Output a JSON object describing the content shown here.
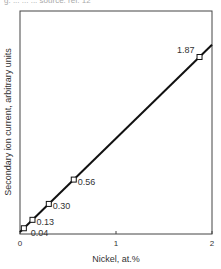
{
  "figure": {
    "caption_fragment": "g. ... ... ... source: ref. 12"
  },
  "chart_data": {
    "type": "line",
    "title": "",
    "xlabel": "Nickel, at.%",
    "ylabel": "Secondary ion current, arbitrary units",
    "xlim": [
      0,
      2
    ],
    "x_ticks": [
      "0",
      "1",
      "2"
    ],
    "grid": false,
    "legend": null,
    "series": [
      {
        "name": "Ni calibration",
        "marker": "open-square",
        "line": "linear fit",
        "points": [
          {
            "x": 0.04,
            "label": "0.04"
          },
          {
            "x": 0.13,
            "label": "0.13"
          },
          {
            "x": 0.3,
            "label": "0.30"
          },
          {
            "x": 0.56,
            "label": "0.56"
          },
          {
            "x": 1.87,
            "label": "1.87"
          }
        ]
      }
    ]
  }
}
